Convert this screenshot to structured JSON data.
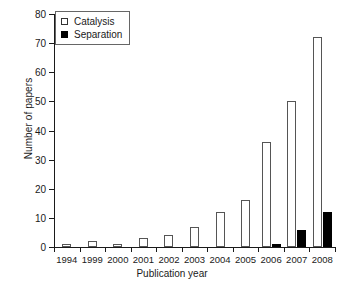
{
  "chart_data": {
    "type": "bar",
    "title": "",
    "xlabel": "Publication year",
    "ylabel": "Number of papers",
    "categories": [
      "1994",
      "1999",
      "2000",
      "2001",
      "2002",
      "2003",
      "2004",
      "2005",
      "2006",
      "2007",
      "2008"
    ],
    "series": [
      {
        "name": "Catalysis",
        "marker": "open-square",
        "color": "#ffffff",
        "edge_color": "#555555",
        "values": [
          1,
          2,
          1,
          3,
          4,
          7,
          12,
          16,
          36,
          50,
          72
        ]
      },
      {
        "name": "Separation",
        "marker": "filled-square",
        "color": "#000000",
        "edge_color": "#000000",
        "values": [
          0,
          0,
          0,
          0,
          0,
          0,
          0,
          0,
          1,
          6,
          12
        ]
      }
    ],
    "ylim": [
      0,
      80
    ],
    "yticks": [
      0,
      10,
      20,
      30,
      40,
      50,
      60,
      70,
      80
    ],
    "ytick_labels": [
      "0",
      "10",
      "20",
      "30",
      "40",
      "50",
      "60",
      "70",
      "80"
    ],
    "grid": false,
    "legend_position": "top-left",
    "legend_entries": [
      "Catalysis",
      "Separation"
    ]
  }
}
